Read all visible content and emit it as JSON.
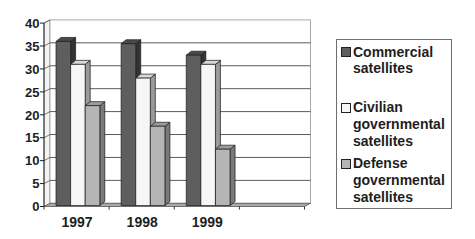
{
  "chart_data": {
    "type": "bar",
    "subtype": "3d-clustered-column",
    "title": "",
    "xlabel": "",
    "ylabel": "",
    "categories": [
      "1997",
      "1998",
      "1999"
    ],
    "category_slots": 4,
    "series": [
      {
        "name": "Commercial satellites",
        "values": [
          36,
          35.5,
          33
        ],
        "color": "#5e5e5e",
        "top_color": "#4a4a4a",
        "side_color": "#333333"
      },
      {
        "name": "Civilian governmental satellites",
        "values": [
          31,
          28,
          31
        ],
        "color": "#f6f6f6",
        "top_color": "#d8d8d8",
        "side_color": "#9a9a9a"
      },
      {
        "name": "Defense governmental satellites",
        "values": [
          22,
          17.5,
          12.5
        ],
        "color": "#b5b5b5",
        "top_color": "#9c9c9c",
        "side_color": "#7a7a7a"
      }
    ],
    "yticks": [
      0,
      5,
      10,
      15,
      20,
      25,
      30,
      35,
      40
    ],
    "ylim": [
      0,
      40
    ],
    "grid": true,
    "legend_position": "right"
  },
  "legend": {
    "items": [
      {
        "lines": [
          "Commercial",
          "satellites"
        ],
        "color": "#5e5e5e"
      },
      {
        "lines": [
          "Civilian",
          "governmental",
          "satellites"
        ],
        "color": "#f6f6f6"
      },
      {
        "lines": [
          "Defense",
          "governmental",
          "satellites"
        ],
        "color": "#b5b5b5"
      }
    ]
  }
}
